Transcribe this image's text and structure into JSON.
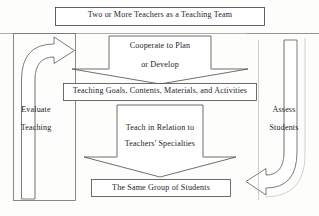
{
  "diagram": {
    "stroke_color": "#3a3a3a",
    "background_color": "#fdfdfc",
    "text_color": "#24231f",
    "nodes": {
      "team_box": {
        "label": "Two or More Teachers as a Teaching Team",
        "shape": "rectangle"
      },
      "cooperate_chevron": {
        "line1": "Cooperate to Plan",
        "line2": "or Develop",
        "shape": "down-arrow"
      },
      "goals_box": {
        "label": "Teaching Goals, Contents, Materials, and Activities",
        "shape": "rectangle"
      },
      "teach_chevron": {
        "line1": "Teach in Relation to",
        "line2": "Teachers' Specialties",
        "shape": "down-arrow"
      },
      "students_box": {
        "label": "The Same Group of Students",
        "shape": "rectangle"
      }
    },
    "side_captions": {
      "left": {
        "line1": "Evaluate",
        "line2": "Teaching"
      },
      "right": {
        "line1": "Assess",
        "line2": "Students"
      }
    },
    "connectors": {
      "left_curved_arrow": "curved-arrow-up-right",
      "right_curved_arrow": "curved-arrow-down-left"
    }
  }
}
